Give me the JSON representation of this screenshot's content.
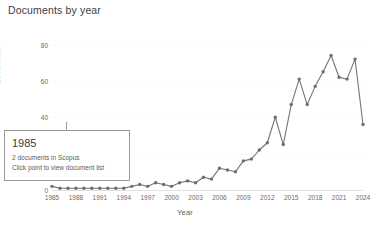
{
  "chart_data": {
    "type": "line",
    "title": "Documents by year",
    "xlabel": "Year",
    "ylabel": "Documents",
    "grid": true,
    "legend": "none",
    "xlim": [
      1985,
      2024
    ],
    "ylim": [
      0,
      88
    ],
    "ytick_values": [
      0,
      20,
      40,
      60,
      80
    ],
    "ytick_labels": [
      "0",
      "20",
      "40",
      "60",
      "80"
    ],
    "xtick_labels": [
      "1985",
      "1988",
      "1991",
      "1994",
      "1997",
      "2000",
      "2003",
      "2006",
      "2009",
      "2012",
      "2015",
      "2018",
      "2021",
      "2024"
    ],
    "x": [
      1985,
      1986,
      1987,
      1988,
      1989,
      1990,
      1991,
      1992,
      1993,
      1994,
      1995,
      1996,
      1997,
      1998,
      1999,
      2000,
      2001,
      2002,
      2003,
      2004,
      2005,
      2006,
      2007,
      2008,
      2009,
      2010,
      2011,
      2012,
      2013,
      2014,
      2015,
      2016,
      2017,
      2018,
      2019,
      2020,
      2021,
      2022,
      2023,
      2024
    ],
    "values": [
      2,
      1,
      1,
      1,
      1,
      1,
      1,
      1,
      1,
      1,
      2,
      3,
      2,
      4,
      3,
      2,
      4,
      5,
      4,
      7,
      6,
      12,
      11,
      10,
      16,
      17,
      22,
      26,
      40,
      25,
      47,
      61,
      47,
      57,
      65,
      74,
      62,
      61,
      72,
      36
    ],
    "marker": "circle",
    "line_color": "#757575",
    "marker_color": "#6e6e6e"
  },
  "tooltip": {
    "year": "1985",
    "count_text": "2 documents in Scopus",
    "hint_text": "Click point to view document list"
  }
}
